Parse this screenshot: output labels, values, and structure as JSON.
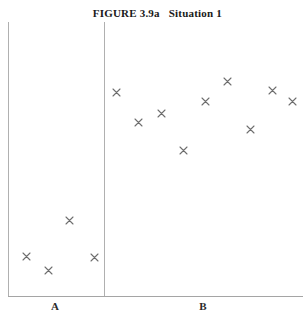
{
  "title": {
    "figure_number": "FIGURE 3.9a",
    "caption": "Situation 1",
    "full": "FIGURE 3.9a    Situation 1"
  },
  "axes": {
    "group_labels": [
      {
        "name": "group-a",
        "label": "A",
        "x": 55
      },
      {
        "name": "group-b",
        "label": "B",
        "x": 203
      }
    ],
    "divider_x": 104,
    "left_axis_x": 8,
    "baseline_y": 296,
    "top_y": 22
  },
  "colors": {
    "marker": "#6e6e6e",
    "axis": "#a8a8a8",
    "title": "#1a1a1a",
    "background": "#ffffff"
  },
  "chart_data": {
    "type": "scatter",
    "xlabel": "",
    "ylabel": "",
    "grid": false,
    "legend": "none",
    "marker": "x",
    "note": "Two-group dot plot. Group A values cluster low; group B values cluster high.",
    "groups": [
      {
        "name": "A",
        "n": 4,
        "points": [
          {
            "x": 69,
            "y": 220
          },
          {
            "x": 26,
            "y": 256
          },
          {
            "x": 94,
            "y": 257
          },
          {
            "x": 48,
            "y": 270
          }
        ]
      },
      {
        "name": "B",
        "n": 9,
        "points": [
          {
            "x": 116,
            "y": 92
          },
          {
            "x": 138,
            "y": 122
          },
          {
            "x": 161,
            "y": 113
          },
          {
            "x": 183,
            "y": 150
          },
          {
            "x": 205,
            "y": 101
          },
          {
            "x": 227,
            "y": 81
          },
          {
            "x": 250,
            "y": 129
          },
          {
            "x": 272,
            "y": 90
          },
          {
            "x": 292,
            "y": 101
          }
        ]
      }
    ]
  }
}
